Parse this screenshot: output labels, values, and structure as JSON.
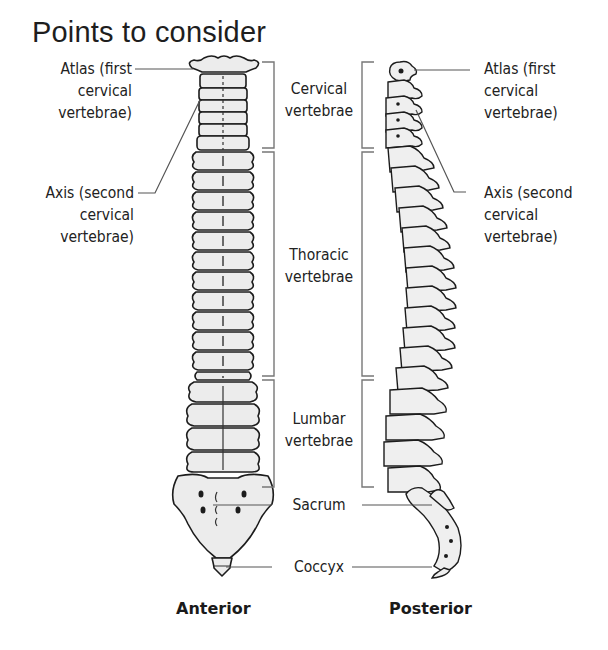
{
  "title": "Points to consider",
  "anterior_labels": {
    "atlas": [
      "Atlas (first",
      "cervical",
      "vertebrae)"
    ],
    "axis": [
      "Axis (second",
      "cervical",
      "vertebrae)"
    ]
  },
  "posterior_labels": {
    "atlas": [
      "Atlas (first",
      "cervical",
      "vertebrae)"
    ],
    "axis": [
      "Axis (second",
      "cervical",
      "vertebrae)"
    ]
  },
  "regions": {
    "cervical": [
      "Cervical",
      "vertebrae"
    ],
    "thoracic": [
      "Thoracic",
      "vertebrae"
    ],
    "lumbar": [
      "Lumbar",
      "vertebrae"
    ],
    "sacrum": "Sacrum",
    "coccyx": "Coccyx"
  },
  "captions": {
    "anterior": "Anterior",
    "posterior": "Posterior"
  },
  "colors": {
    "bone_fill": "#ececec",
    "outline": "#1c1c1c",
    "leader_line": "#555555",
    "bracket": "#777777"
  }
}
